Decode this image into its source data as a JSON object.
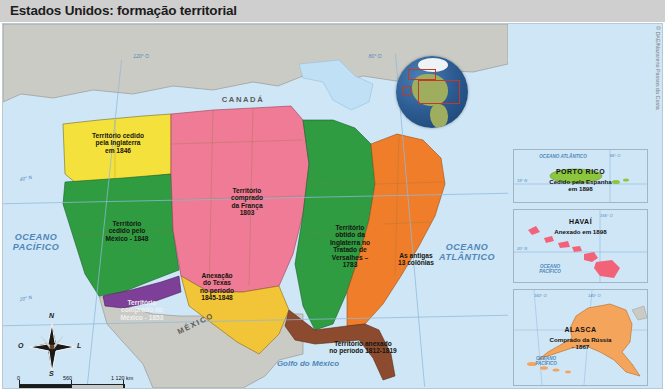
{
  "header": {
    "title": "Estados Unidos: formação territorial"
  },
  "credit": {
    "text": "© DAE/Nazareno Passos da Costa"
  },
  "map": {
    "countries": [
      {
        "name": "canada",
        "label": "CANADÁ"
      },
      {
        "name": "mexico",
        "label": "MÉXICO"
      }
    ],
    "oceans": [
      {
        "name": "pacific",
        "label": "OCEANO\nPACÍFICO"
      },
      {
        "name": "atlantic",
        "label": "OCEANO\nATLÂNTICO"
      }
    ],
    "gulf": {
      "label": "Golfo do México"
    },
    "graticule": [
      {
        "name": "lon-120",
        "label": "120° O"
      },
      {
        "name": "lon-80",
        "label": "80° O"
      },
      {
        "name": "lat-40",
        "label": "40° N"
      },
      {
        "name": "lat-20",
        "label": "20° N"
      }
    ],
    "territories": [
      {
        "name": "oregon-1846",
        "label": "Território cedido\npela Inglaterra\nem 1846",
        "color": "#f5e13c"
      },
      {
        "name": "mexican-cession-1848",
        "label": "Território\ncedido pelo\nMéxico - 1848",
        "color": "#2f9c42"
      },
      {
        "name": "louisiana-1803",
        "label": "Território\ncomprado\nda França\n1803",
        "color": "#ef7b96"
      },
      {
        "name": "versailles-1783",
        "label": "Território\nobtido da\nInglaterra no\nTratado de\nVersalhes –\n1783",
        "color": "#2f9c42"
      },
      {
        "name": "thirteen-colonies",
        "label": "As antigas\n13 colônias",
        "color": "#f07d2a"
      },
      {
        "name": "texas-1845-1848",
        "label": "Anexação\ndo Texas\nno período\n1845-1848",
        "color": "#f2c438"
      },
      {
        "name": "gadsden-1853",
        "label": "Território\ncomprado do\nMéxico - 1853",
        "color": "#7d3f98"
      },
      {
        "name": "florida-1812-1819",
        "label": "Território anexado\nno período 1812-1819",
        "color": "#8c4a2f"
      }
    ]
  },
  "insets": [
    {
      "name": "porto-rico",
      "title": "PORTO RICO",
      "subtitle": "Cedido pela Espanha\nem 1898",
      "ocean": "OCEANO  ATLÂNTICO",
      "graticule": [
        "66° O",
        "18° N"
      ]
    },
    {
      "name": "havai",
      "title": "HAVAÍ",
      "subtitle": "Anexado em 1898",
      "ocean": "OCEANO\nPACÍFICO",
      "graticule": [
        "156° O",
        "20° N"
      ]
    },
    {
      "name": "alasca",
      "title": "ALASCA",
      "subtitle": "Comprado da Rússia\n- 1867",
      "ocean": "OCEANO\nPACÍFICO",
      "graticule": [
        "160° O",
        "140° O"
      ]
    }
  ],
  "compass": {
    "north": "N",
    "south": "S",
    "east": "L",
    "west": "O"
  },
  "scale": {
    "zero": "0",
    "mid": "560",
    "max": "1 120 km",
    "ratio": "1 : 56 000 000"
  }
}
